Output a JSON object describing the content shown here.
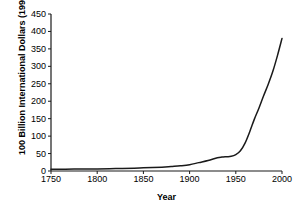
{
  "chart_data": {
    "type": "line",
    "title": "",
    "xlabel": "Year",
    "ylabel": "100 Billion International Dollars (1990)",
    "xlim": [
      1750,
      2000
    ],
    "ylim": [
      0,
      450
    ],
    "grid": false,
    "legend": null,
    "xticks": [
      "1750",
      "1800",
      "1850",
      "1900",
      "1950",
      "2000"
    ],
    "xtick_values": [
      1750,
      1800,
      1850,
      1900,
      1950,
      2000
    ],
    "yticks": [
      "0",
      "50",
      "100",
      "150",
      "200",
      "250",
      "300",
      "350",
      "400",
      "450"
    ],
    "ytick_values": [
      0,
      50,
      100,
      150,
      200,
      250,
      300,
      350,
      400,
      450
    ],
    "series": [
      {
        "name": "World GDP",
        "color": "#1a1a1a",
        "x": [
          1750,
          1775,
          1800,
          1820,
          1840,
          1850,
          1870,
          1880,
          1890,
          1900,
          1910,
          1920,
          1930,
          1935,
          1940,
          1945,
          1950,
          1955,
          1960,
          1965,
          1970,
          1975,
          1980,
          1985,
          1990,
          1995,
          2000
        ],
        "values": [
          5,
          5.5,
          6,
          7,
          8,
          9,
          11,
          13,
          15,
          18,
          24,
          30,
          38,
          40,
          41,
          42,
          47,
          58,
          80,
          112,
          148,
          180,
          215,
          248,
          285,
          330,
          380
        ]
      }
    ]
  }
}
